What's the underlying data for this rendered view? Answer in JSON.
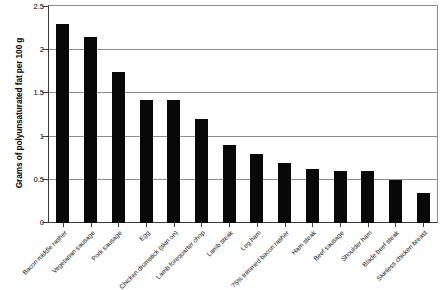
{
  "chart_data": {
    "type": "bar",
    "title": "",
    "xlabel": "",
    "ylabel": "Grams of polyunsaturated fat per 100 g",
    "ylim": [
      0,
      2.5
    ],
    "yticks": [
      "0",
      "0.5",
      "1",
      "1.5",
      "2",
      "2.5"
    ],
    "ytick_values": [
      0,
      0.5,
      1,
      1.5,
      2,
      2.5
    ],
    "grid": true,
    "legend": "none",
    "bar_color": "#080808",
    "categories": [
      "Bacon middle rasher",
      "Vegetarian sausage",
      "Pork sausage",
      "Egg",
      "Chicken drumstick (skin on)",
      "Lamb forequarter chop",
      "Lamb steak",
      "Leg ham",
      "75% trimmed bacon rasher",
      "Ham steak",
      "Beef sausage",
      "Shoulder ham",
      "Blade beef steak",
      "Skinless chicken breast"
    ],
    "values": [
      2.3,
      2.15,
      1.75,
      1.42,
      1.42,
      1.2,
      0.9,
      0.8,
      0.7,
      0.62,
      0.6,
      0.6,
      0.5,
      0.35
    ]
  }
}
